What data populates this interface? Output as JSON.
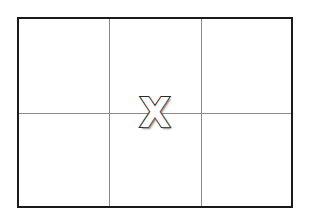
{
  "viewport": {
    "width": 309,
    "height": 220,
    "background_color": "#ffffff"
  },
  "frame": {
    "name": "composition-grid",
    "border_color": "#1a1a1a",
    "border_width_px": 2.5,
    "fill_color": "#ffffff",
    "x": 17,
    "y": 17,
    "width": 276,
    "height": 191,
    "columns": 3,
    "rows": 2
  },
  "grid": {
    "line_color": "#8a8a8a",
    "line_width_px": 1,
    "vertical_lines": [
      {
        "label": "v1",
        "offset_px": 90
      },
      {
        "label": "v2",
        "offset_px": 182
      }
    ],
    "horizontal_lines": [
      {
        "label": "h1",
        "offset_px": 94
      }
    ]
  },
  "cells": [
    {
      "label": "top-left",
      "row": 1,
      "col": 1
    },
    {
      "label": "top-center",
      "row": 1,
      "col": 2
    },
    {
      "label": "top-right",
      "row": 1,
      "col": 3
    },
    {
      "label": "bottom-left",
      "row": 2,
      "col": 1
    },
    {
      "label": "bottom-center",
      "row": 2,
      "col": 2
    },
    {
      "label": "bottom-right",
      "row": 2,
      "col": 3
    }
  ],
  "marker": {
    "name": "x-marker",
    "symbol": "X",
    "fill_color": "#ffffff",
    "outline_color": "#2b2b2b",
    "shadow_color": "#8c8c8c",
    "font_size_px": 40,
    "center_x": 155,
    "center_y": 113
  }
}
